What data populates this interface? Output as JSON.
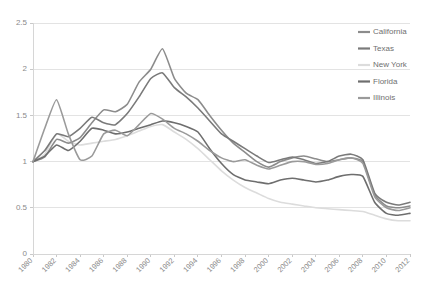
{
  "chart_data": {
    "type": "line",
    "title": "",
    "subtitle": "",
    "xlabel": "",
    "ylabel": "",
    "xlim": [
      1980,
      2012
    ],
    "ylim": [
      0,
      2.5
    ],
    "yticks": [
      0,
      0.5,
      1,
      1.5,
      2,
      2.5
    ],
    "ytick_labels": [
      "0",
      "0.5",
      "1",
      "1.5",
      "2",
      "2.5"
    ],
    "xticks": [
      1980,
      1982,
      1984,
      1986,
      1988,
      1990,
      1992,
      1994,
      1996,
      1998,
      2000,
      2002,
      2004,
      2006,
      2008,
      2010,
      2012
    ],
    "xtick_labels": [
      "1980",
      "1982",
      "1984",
      "1986",
      "1988",
      "1990",
      "1992",
      "1994",
      "1996",
      "1998",
      "2000",
      "2002",
      "2004",
      "2006",
      "2008",
      "2010",
      "2012"
    ],
    "grid": "horizontal",
    "legend_position": "top-right",
    "x": [
      1980,
      1981,
      1982,
      1983,
      1984,
      1985,
      1986,
      1987,
      1988,
      1989,
      1990,
      1991,
      1992,
      1993,
      1994,
      1995,
      1996,
      1997,
      1998,
      1999,
      2000,
      2001,
      2002,
      2003,
      2004,
      2005,
      2006,
      2007,
      2008,
      2009,
      2010,
      2011,
      2012
    ],
    "series": [
      {
        "name": "California",
        "color": "#8c8c8c",
        "values": [
          1.0,
          1.05,
          1.24,
          1.2,
          1.26,
          1.42,
          1.56,
          1.54,
          1.62,
          1.86,
          2.0,
          2.22,
          1.9,
          1.74,
          1.67,
          1.5,
          1.34,
          1.2,
          1.1,
          1.0,
          0.94,
          1.0,
          1.04,
          1.06,
          1.03,
          1.0,
          1.02,
          1.04,
          1.0,
          0.64,
          0.52,
          0.5,
          0.52
        ]
      },
      {
        "name": "Texas",
        "color": "#7a7a7a",
        "values": [
          1.0,
          1.12,
          1.3,
          1.27,
          1.36,
          1.48,
          1.42,
          1.4,
          1.52,
          1.7,
          1.9,
          1.96,
          1.8,
          1.7,
          1.58,
          1.44,
          1.3,
          1.22,
          1.14,
          1.06,
          0.99,
          1.02,
          1.05,
          1.02,
          0.98,
          1.0,
          1.06,
          1.08,
          1.02,
          0.66,
          0.56,
          0.53,
          0.56
        ]
      },
      {
        "name": "New York",
        "color": "#dcdcdc",
        "values": [
          1.0,
          1.08,
          1.3,
          1.22,
          1.18,
          1.2,
          1.22,
          1.24,
          1.28,
          1.33,
          1.38,
          1.4,
          1.32,
          1.24,
          1.14,
          1.02,
          0.9,
          0.8,
          0.72,
          0.66,
          0.6,
          0.56,
          0.54,
          0.52,
          0.5,
          0.49,
          0.48,
          0.47,
          0.46,
          0.42,
          0.38,
          0.36,
          0.36
        ]
      },
      {
        "name": "Florida",
        "color": "#6e6e6e",
        "values": [
          1.0,
          1.06,
          1.18,
          1.12,
          1.22,
          1.36,
          1.34,
          1.3,
          1.32,
          1.36,
          1.4,
          1.44,
          1.42,
          1.38,
          1.32,
          1.14,
          0.98,
          0.86,
          0.8,
          0.78,
          0.76,
          0.8,
          0.82,
          0.8,
          0.78,
          0.8,
          0.84,
          0.86,
          0.84,
          0.56,
          0.44,
          0.42,
          0.44
        ]
      },
      {
        "name": "Illinois",
        "color": "#9a9a9a",
        "values": [
          1.0,
          1.36,
          1.67,
          1.3,
          1.02,
          1.06,
          1.3,
          1.34,
          1.28,
          1.4,
          1.52,
          1.46,
          1.36,
          1.3,
          1.22,
          1.12,
          1.04,
          1.0,
          1.02,
          0.96,
          0.92,
          0.96,
          1.0,
          1.0,
          0.97,
          0.98,
          1.02,
          1.04,
          0.98,
          0.62,
          0.5,
          0.47,
          0.5
        ]
      }
    ]
  },
  "legend": {
    "entries": [
      {
        "label": "California"
      },
      {
        "label": "Texas"
      },
      {
        "label": "New York"
      },
      {
        "label": "Florida"
      },
      {
        "label": "Illinois"
      }
    ]
  }
}
